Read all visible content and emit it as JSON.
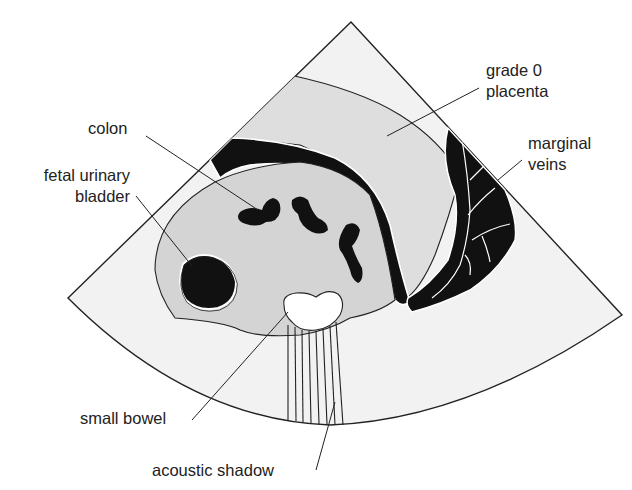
{
  "figure": {
    "title": "",
    "colors": {
      "background": "#ffffff",
      "sector_fill": "#f2f2f2",
      "placenta_fill": "#dedede",
      "fetus_fill": "#d4d4d4",
      "fluid_black": "#111111",
      "outline": "#222222",
      "bowel_echo": "#ffffff"
    }
  },
  "labels": {
    "placenta": {
      "line1": "grade 0",
      "line2": "placenta"
    },
    "colon": {
      "line1": "colon"
    },
    "bladder": {
      "line1": "fetal urinary",
      "line2": "bladder"
    },
    "marginal_veins": {
      "line1": "marginal",
      "line2": "veins"
    },
    "small_bowel": {
      "line1": "small bowel"
    },
    "acoustic_shadow": {
      "line1": "acoustic shadow"
    }
  }
}
